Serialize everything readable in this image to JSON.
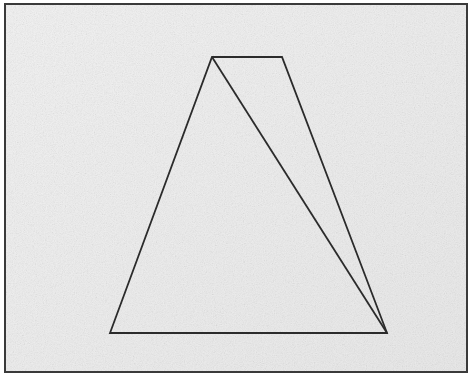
{
  "figure": {
    "canvas": {
      "width": 475,
      "height": 382
    },
    "colors": {
      "page_background": "#ffffff",
      "panel_background": "#efefef",
      "panel_background_secondary": "#e7e7e7",
      "stroke": "#2b2b2b",
      "border_stroke": "#3a3a3a",
      "grain": "#d8d8d8"
    },
    "border": {
      "name": "outer-frame",
      "x": 5,
      "y": 4,
      "width": 462,
      "height": 368,
      "stroke_width": 2
    },
    "shapes": [
      {
        "id": "trapezoid",
        "label": "trapezoid-outline",
        "type": "polygon",
        "closed": true,
        "stroke_width": 1.8,
        "points": [
          {
            "label": "apex-left",
            "x": 212,
            "y": 57
          },
          {
            "label": "top-right",
            "x": 282,
            "y": 57
          },
          {
            "label": "bottom-right",
            "x": 387,
            "y": 333
          },
          {
            "label": "bottom-left",
            "x": 110,
            "y": 333
          }
        ]
      },
      {
        "id": "diagonal",
        "label": "internal-diagonal-line",
        "type": "line",
        "closed": false,
        "stroke_width": 1.8,
        "points": [
          {
            "label": "from-apex-left",
            "x": 212,
            "y": 57
          },
          {
            "label": "to-bottom-right",
            "x": 387,
            "y": 333
          }
        ]
      }
    ]
  }
}
